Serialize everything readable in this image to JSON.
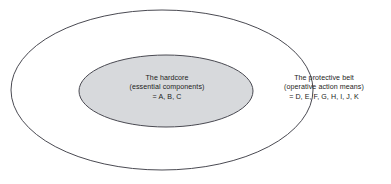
{
  "diagram": {
    "type": "concentric-ellipse-venn",
    "background_color": "#ffffff",
    "stroke_color": "#4a4a52",
    "inner_fill_color": "#d7d9dc",
    "text_color": "#1d1d22",
    "outer_ellipse": {
      "name": "protective-belt-region",
      "cx": 162,
      "cy": 90,
      "rx": 151,
      "ry": 80
    },
    "inner_ellipse": {
      "name": "hardcore-region",
      "cx": 166,
      "cy": 91,
      "rx": 87,
      "ry": 36
    },
    "labels": {
      "hardcore": {
        "line1": "The hardcore",
        "line2": "(essential components)",
        "line3": "= A, B, C"
      },
      "protective_belt": {
        "line1": "The protective belt",
        "line2": "(operative action means)",
        "line3": "= D, E, F, G, H, I, J, K"
      }
    }
  }
}
